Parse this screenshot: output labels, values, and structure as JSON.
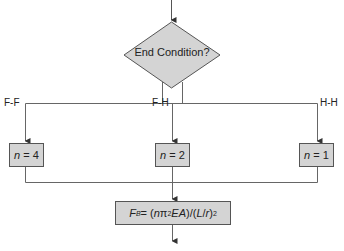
{
  "diagram": {
    "decision": {
      "label": "End Condition?"
    },
    "branches": [
      {
        "label": "F-F",
        "n_var": "n",
        "n_value": "= 4"
      },
      {
        "label": "F-H",
        "n_var": "n",
        "n_value": "= 2"
      },
      {
        "label": "H-H",
        "n_var": "n",
        "n_value": "= 1"
      }
    ],
    "result": {
      "lhs": "F",
      "lhs_sub": "B",
      "eq": " = (",
      "n": "n",
      "pi": "π",
      "pi_sup": "2",
      "ea": " EA",
      "mid": ")/(",
      "l": "L",
      "slash": "/",
      "r": "r",
      "close": ")",
      "sq": "2"
    },
    "colors": {
      "fill": "#d4d4d4",
      "stroke": "#555555",
      "line": "#666666"
    }
  }
}
